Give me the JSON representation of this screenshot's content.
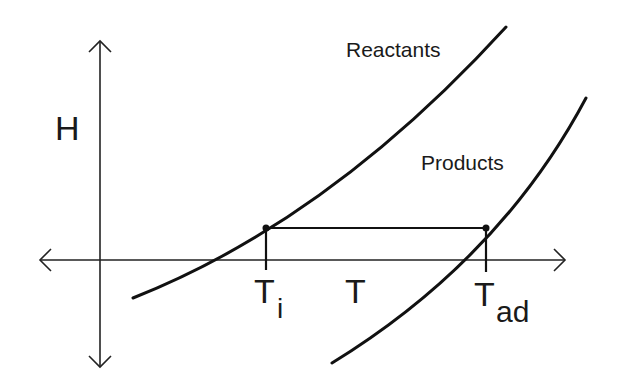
{
  "diagram": {
    "type": "enthalpy-temperature diagram",
    "axes": {
      "vertical_label": "H",
      "horizontal_label": "T"
    },
    "curves": [
      {
        "id": "reactants",
        "label": "Reactants"
      },
      {
        "id": "products",
        "label": "Products"
      }
    ],
    "markers": {
      "initial_temp": {
        "main": "T",
        "sub": "i"
      },
      "adiabatic_temp": {
        "main": "T",
        "sub": "ad"
      }
    },
    "colors": {
      "ink": "#111111",
      "background": "#ffffff"
    }
  }
}
